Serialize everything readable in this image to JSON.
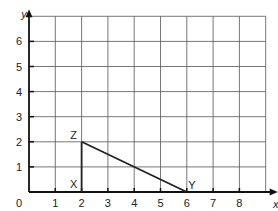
{
  "diagram": {
    "type": "coordinate-grid",
    "axes": {
      "x_label": "x",
      "y_label": "y",
      "origin_label": "0"
    },
    "x_ticks": [
      "1",
      "2",
      "3",
      "4",
      "5",
      "6",
      "7",
      "8"
    ],
    "y_ticks": [
      "1",
      "2",
      "3",
      "4",
      "5",
      "6"
    ],
    "x_range": [
      0,
      9
    ],
    "y_range": [
      0,
      7
    ],
    "grid": true,
    "points": [
      {
        "label": "X",
        "x": 2,
        "y": 0
      },
      {
        "label": "Y",
        "x": 6,
        "y": 0
      },
      {
        "label": "Z",
        "x": 2,
        "y": 2
      }
    ],
    "segments": [
      [
        "X",
        "Z"
      ],
      [
        "Z",
        "Y"
      ]
    ],
    "colors": {
      "grid": "#555555",
      "axis": "#111111",
      "line": "#222222"
    }
  }
}
